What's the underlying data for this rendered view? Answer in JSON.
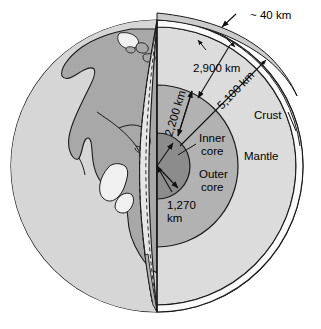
{
  "figure": {
    "background_color": "#ffffff",
    "outline_color": "#1a1a1a"
  },
  "colors": {
    "ocean": "#d4d4d4",
    "land": "#a8a8a8",
    "crust_band": "#f2f2f2",
    "mantle": "#d9d9d9",
    "outer_core": "#b0b0b0",
    "inner_core": "#8a8a8a",
    "cut_wedge": "#e8e8e8",
    "stroke": "#1a1a1a"
  },
  "labels": {
    "crust_thickness": "~ 40 km",
    "mantle_depth": "2,900 km",
    "outer_core_depth": "5,100 km",
    "outer_core_thickness": "2,200 km",
    "inner_core_diameter_line1": "1,270",
    "inner_core_diameter_line2": "km",
    "crust": "Crust",
    "mantle": "Mantle",
    "inner_core_line1": "Inner",
    "inner_core_line2": "core",
    "outer_core_line1": "Outer",
    "outer_core_line2": "core"
  },
  "geometry": {
    "center_x": 157,
    "center_y": 166,
    "earth_radius": 146,
    "crust_inner_radius": 139,
    "outer_core_radius": 81,
    "inner_core_radius": 33
  },
  "annotations": [
    {
      "name": "crust-thickness",
      "text": "~ 40 km",
      "value_km": 40,
      "layer": "crust"
    },
    {
      "name": "mantle-depth",
      "text": "2,900 km",
      "value_km": 2900,
      "layer": "mantle"
    },
    {
      "name": "outer-core-depth",
      "text": "5,100 km",
      "value_km": 5100,
      "layer": "outer core"
    },
    {
      "name": "outer-core-thickness",
      "text": "2,200 km",
      "value_km": 2200,
      "layer": "outer core"
    },
    {
      "name": "inner-core-diameter",
      "text": "1,270 km",
      "value_km": 1270,
      "layer": "inner core"
    }
  ]
}
